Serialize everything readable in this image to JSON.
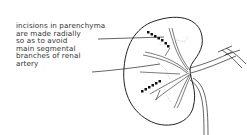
{
  "diagram": {
    "annotation_lines": [
      "incisions in parenchyma",
      "are made radially",
      "so as to avoid",
      "main segmental",
      "branches of renal",
      "artery"
    ],
    "colors": {
      "line": "#222222",
      "text": "#333333",
      "background": "#ffffff"
    }
  }
}
